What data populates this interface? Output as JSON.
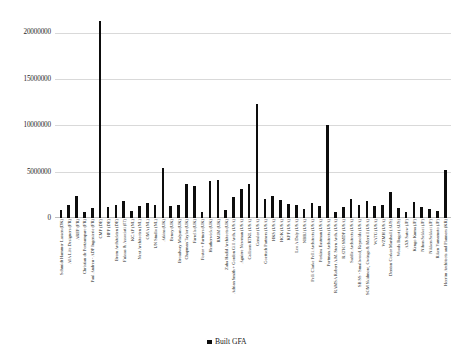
{
  "chart_data": {
    "type": "bar",
    "title": "",
    "xlabel": "",
    "ylabel": "",
    "ylim": [
      0,
      22000000
    ],
    "grid": true,
    "legend_position": "bottom",
    "series_name": "Built GFA",
    "yticks": [
      "0",
      "5000000",
      "10000000",
      "15000000",
      "20000000"
    ],
    "ytick_values": [
      0,
      5000000,
      10000000,
      15000000,
      20000000
    ],
    "categories": [
      "Schmidt Hammer Lassen (DK)",
      "AIA Life Designers (FR)",
      "AREP (FR)",
      "Christian de Portzamparc (FR)",
      "Paul Andreu - ADP Ingenierie (FR)",
      "CMP (DE)",
      "HPP (DE)",
      "Brem Architekten (DE)",
      "Fuksas & Associati (IT)",
      "KCAP (NL)",
      "Next Architecten (NL)",
      "OMA (NL)",
      "UN Studio (NL)",
      "Atkins (UK)",
      "Benoy (UK)",
      "Broadway Malyan (UK)",
      "Chapman Taylor (UK)",
      "Farrells (UK)",
      "Foster + Partners (UK)",
      "Heatherwick (UK)",
      "RMJM (UK)",
      "Zaha Hadid Architects (UK)",
      "Adrian Smith + Gordon Gill Arch. (USA)",
      "Aguirre Newman (USA)",
      "Callison RTKL (USA)",
      "Gensler (USA)",
      "Goettsch Partners (USA)",
      "HKS (USA)",
      "HOK (USA)",
      "KPF (USA)",
      "Leo A Daly (USA)",
      "NBBJ (USA)",
      "Pelli Clarke Pelli Architects (USA)",
      "Perkins Eastman (USA)",
      "Portman Architects (USA)",
      "RAMSA Robert A.M. Stern Arch. (USA)",
      "RATIO SMDP (USA)",
      "Safdie Architects (USA)",
      "SB SS - Smallwood, Reynolds (USA)",
      "SOM Skidmore, Owings & Merrill (USA)",
      "WATG (USA)",
      "WZMH (USA)",
      "Denton Corker Marshall (AUS)",
      "Woods Bagot (AUS)",
      "AXS Satow (JP)",
      "Kengo Kuma (JP)",
      "Nihon Sekkei (JP)",
      "Nikken Sekkei (JP)",
      "Riken Yamamoto (JP)",
      "Heerim Architects and Planners (KR)"
    ],
    "values": [
      900000,
      1450000,
      2350000,
      700000,
      1100000,
      21200000,
      1150000,
      1350000,
      1850000,
      800000,
      1250000,
      1600000,
      1450000,
      5350000,
      1300000,
      1450000,
      3650000,
      3400000,
      600000,
      4000000,
      4150000,
      850000,
      2300000,
      3150000,
      3650000,
      12300000,
      2050000,
      2350000,
      1950000,
      1500000,
      1350000,
      1000000,
      1600000,
      1250000,
      10000000,
      700000,
      1150000,
      2050000,
      1400000,
      1800000,
      1250000,
      1450000,
      2850000,
      1100000,
      650000,
      1700000,
      1200000,
      950000,
      800000,
      5150000
    ]
  },
  "legend": {
    "label": "Built GFA",
    "color": "#0d0d0d"
  }
}
